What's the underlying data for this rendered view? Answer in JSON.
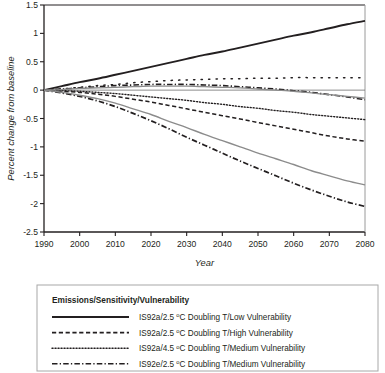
{
  "chart_data": {
    "type": "line",
    "title": "",
    "xlabel": "Year",
    "ylabel": "Percent change from baseline",
    "xlim": [
      1990,
      2080
    ],
    "ylim": [
      -2.5,
      1.5
    ],
    "xticks": [
      "1990",
      "2000",
      "2010",
      "2020",
      "2030",
      "2040",
      "2050",
      "2060",
      "2070",
      "2080"
    ],
    "yticks": [
      "1.5",
      "1",
      "0.5",
      "0",
      "-0.5",
      "-1",
      "-1.5",
      "-2",
      "-2.5"
    ],
    "xtick_values": [
      1990,
      2000,
      2010,
      2020,
      2030,
      2040,
      2050,
      2060,
      2070,
      2080
    ],
    "ytick_values": [
      1.5,
      1,
      0.5,
      0,
      -0.5,
      -1,
      -1.5,
      -2,
      -2.5
    ],
    "grid": false,
    "legend_position": "below-plot",
    "x": [
      1990,
      1995,
      2000,
      2005,
      2010,
      2015,
      2020,
      2025,
      2030,
      2035,
      2040,
      2045,
      2050,
      2055,
      2060,
      2065,
      2070,
      2075,
      2080
    ],
    "series": [
      {
        "name": "IS92a/2.5 ºC Doubling T/Low Vulnerability",
        "style": "solid",
        "color": "#231f20",
        "width": 1.9,
        "in_legend": true,
        "values": [
          0,
          0.07,
          0.14,
          0.2,
          0.27,
          0.34,
          0.41,
          0.48,
          0.55,
          0.62,
          0.68,
          0.75,
          0.82,
          0.89,
          0.96,
          1.02,
          1.09,
          1.16,
          1.22
        ]
      },
      {
        "name": "IS92a/2.5 ºC Doubling T/High Vulnerability",
        "style": "dashed",
        "color": "#231f20",
        "width": 1.5,
        "in_legend": true,
        "values": [
          0,
          -0.02,
          -0.04,
          -0.07,
          -0.11,
          -0.16,
          -0.21,
          -0.27,
          -0.33,
          -0.39,
          -0.45,
          -0.51,
          -0.57,
          -0.63,
          -0.69,
          -0.75,
          -0.81,
          -0.86,
          -0.9
        ]
      },
      {
        "name": "IS92a/4.5 ºC Doubling T/Medium Vulnerability",
        "style": "dotted",
        "color": "#231f20",
        "width": 1.4,
        "in_legend": true,
        "values": [
          0,
          -0.01,
          -0.02,
          -0.04,
          -0.06,
          -0.09,
          -0.12,
          -0.15,
          -0.18,
          -0.22,
          -0.25,
          -0.29,
          -0.32,
          -0.36,
          -0.39,
          -0.43,
          -0.46,
          -0.49,
          -0.52
        ]
      },
      {
        "name": "IS92e/2.5 ºC Doubling T/Medium Vulnerability",
        "style": "dashdot",
        "color": "#231f20",
        "width": 1.7,
        "in_legend": true,
        "values": [
          0,
          -0.05,
          -0.11,
          -0.19,
          -0.29,
          -0.41,
          -0.54,
          -0.68,
          -0.83,
          -0.97,
          -1.11,
          -1.25,
          -1.38,
          -1.51,
          -1.64,
          -1.76,
          -1.87,
          -1.97,
          -2.05
        ]
      },
      {
        "name": "unlabeled-sparse-dotted",
        "style": "sparse-dotted",
        "color": "#231f20",
        "width": 1.5,
        "in_legend": false,
        "values": [
          0,
          0.02,
          0.05,
          0.08,
          0.1,
          0.13,
          0.15,
          0.17,
          0.18,
          0.19,
          0.2,
          0.2,
          0.21,
          0.21,
          0.22,
          0.22,
          0.22,
          0.22,
          0.22
        ]
      },
      {
        "name": "unlabeled-dashdot-upper",
        "style": "dashdot",
        "color": "#231f20",
        "width": 1.6,
        "in_legend": false,
        "values": [
          0,
          0.02,
          0.04,
          0.06,
          0.08,
          0.09,
          0.1,
          0.1,
          0.1,
          0.09,
          0.08,
          0.06,
          0.04,
          0.02,
          -0.01,
          -0.04,
          -0.08,
          -0.12,
          -0.17
        ]
      },
      {
        "name": "unlabeled-gray-upper",
        "style": "solid",
        "color": "#8c8c8c",
        "width": 1.3,
        "in_legend": false,
        "values": [
          0,
          0.01,
          0.03,
          0.04,
          0.05,
          0.06,
          0.07,
          0.07,
          0.07,
          0.06,
          0.05,
          0.04,
          0.02,
          0.0,
          -0.02,
          -0.05,
          -0.08,
          -0.11,
          -0.14
        ]
      },
      {
        "name": "unlabeled-gray-lower",
        "style": "solid",
        "color": "#8c8c8c",
        "width": 1.4,
        "in_legend": false,
        "values": [
          0,
          -0.04,
          -0.09,
          -0.15,
          -0.23,
          -0.33,
          -0.43,
          -0.55,
          -0.66,
          -0.78,
          -0.89,
          -1.0,
          -1.11,
          -1.21,
          -1.31,
          -1.42,
          -1.51,
          -1.6,
          -1.67
        ]
      }
    ]
  },
  "legend": {
    "title": "Emissions/Sensitivity/Vulnerability",
    "entries": [
      {
        "label_pre": "IS92a/2.5 ",
        "sup": "o",
        "label_post": "C Doubling T/Low Vulnerability",
        "style": "solid"
      },
      {
        "label_pre": "IS92a/2.5 ",
        "sup": "o",
        "label_post": "C Doubling T/High Vulnerability",
        "style": "dashed"
      },
      {
        "label_pre": "IS92a/4.5 ",
        "sup": "o",
        "label_post": "C Doubling T/Medium Vulnerability",
        "style": "dotted"
      },
      {
        "label_pre": "IS92e/2.5 ",
        "sup": "o",
        "label_post": "C Doubling T/Medium Vulnerability",
        "style": "dashdot"
      }
    ]
  },
  "colors": {
    "axis": "#231f20",
    "gray_series": "#8c8c8c",
    "background": "#ffffff",
    "legend_border": "#a8a8a8"
  }
}
